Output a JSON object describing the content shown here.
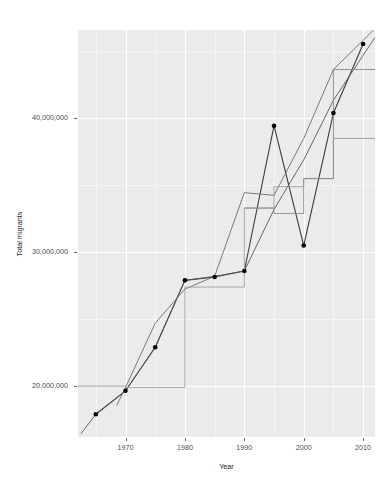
{
  "chart_data": {
    "type": "line",
    "title": "",
    "xlabel": "Year",
    "ylabel": "Total migrants",
    "xlim": [
      1962,
      2012
    ],
    "ylim": [
      16200000,
      46600000
    ],
    "grid": true,
    "legend": "none",
    "x_ticks": [
      1970,
      1980,
      1990,
      2000,
      2010
    ],
    "x_tick_labels": [
      "1970",
      "1980",
      "1990",
      "2000",
      "2010"
    ],
    "y_ticks": [
      20000000,
      30000000,
      40000000
    ],
    "y_tick_labels": [
      "20,000,000",
      "30,000,000",
      "40,000,000"
    ],
    "y_minor_ticks": [
      25000000,
      35000000,
      45000000
    ],
    "x_minor_ticks": [
      1965,
      1975,
      1985,
      1995,
      2005
    ],
    "panel_background": "#ebebeb",
    "gridline_color": "#ffffff",
    "point_color": "#000000",
    "series": [
      {
        "name": "observed-points",
        "style": "line+points",
        "color": "#3c3c3c",
        "width": 1.1,
        "point_size": 4.6,
        "x": [
          1965,
          1970,
          1975,
          1980,
          1985,
          1990,
          1995,
          2000,
          2005,
          2010
        ],
        "values": [
          17900000,
          19650000,
          22900000,
          27900000,
          28150000,
          28600000,
          39450000,
          30500000,
          40400000,
          45550000
        ]
      },
      {
        "name": "revision-a",
        "style": "line",
        "color": "#575757",
        "width": 0.9,
        "x": [
          1962.5,
          1965,
          1970,
          1975,
          1980,
          1985,
          1990,
          1995,
          2000,
          2005,
          2012
        ],
        "values": [
          16450000,
          17900000,
          19650000,
          22900000,
          27900000,
          28200000,
          28600000,
          33200000,
          36900000,
          41350000,
          46050000
        ]
      },
      {
        "name": "revision-b",
        "style": "line",
        "color": "#6e6e6e",
        "width": 0.9,
        "x": [
          1968.5,
          1970,
          1975,
          1980,
          1985,
          1990,
          1995,
          2000,
          2005,
          2012
        ],
        "values": [
          18550000,
          19900000,
          24700000,
          27250000,
          28200000,
          34450000,
          34250000,
          38500000,
          43650000,
          46700000
        ]
      },
      {
        "name": "revision-c",
        "style": "line-step",
        "color": "#9c9c9c",
        "width": 0.9,
        "x": [
          1962,
          1968.5,
          1970,
          1980,
          1990,
          1995,
          2000,
          2005,
          2012
        ],
        "values": [
          20000000,
          20000000,
          19900000,
          27400000,
          33300000,
          34900000,
          35500000,
          38500000,
          38500000
        ]
      },
      {
        "name": "revision-d",
        "style": "line-step",
        "color": "#8a8a8a",
        "width": 0.9,
        "x": [
          1990,
          1995,
          2000,
          2005,
          2012
        ],
        "values": [
          33300000,
          32900000,
          35500000,
          43650000,
          43650000
        ]
      }
    ]
  },
  "axis": {
    "y_title": "Total migrants",
    "x_title": "Year"
  }
}
